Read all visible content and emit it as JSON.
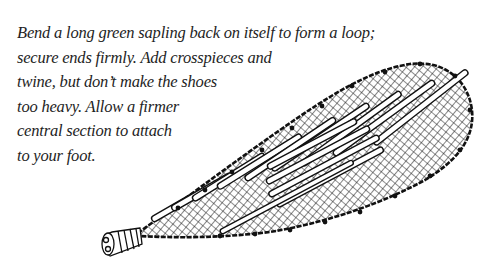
{
  "caption": {
    "lines": [
      "Bend a long green sapling back on itself to form a loop;",
      "secure ends firmly. Add crosspieces and",
      "twine, but don’t make the shoes",
      "too heavy. Allow a firmer",
      "central section to attach",
      "to your foot."
    ]
  },
  "illustration": {
    "subject": "snowshoe",
    "line_color": "#111111",
    "fill_color": "#ffffff"
  }
}
